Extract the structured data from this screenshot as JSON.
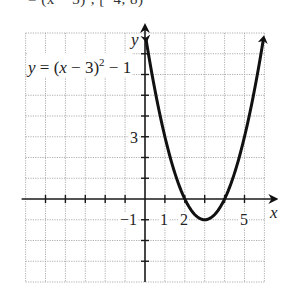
{
  "header": {
    "cut_text": "= (x − 3)², [−4, 8)"
  },
  "chart_data": {
    "type": "line",
    "title": "",
    "function": "y = (x - 3)^2 - 1",
    "equation_label": {
      "lhs": "y",
      "mid": " = (",
      "var": "x",
      "rhs": " − 3)",
      "exp": "2",
      "tail": " − 1"
    },
    "xlabel": "x",
    "ylabel": "y",
    "xlim": [
      -6,
      6
    ],
    "ylim": [
      -4,
      8
    ],
    "grid": true,
    "grid_style": "dotted",
    "x_tick_labels": [
      {
        "value": 1,
        "label": "1"
      },
      {
        "value": 2,
        "label": "2"
      },
      {
        "value": 5,
        "label": "5"
      }
    ],
    "y_tick_labels": [
      {
        "value": 3,
        "label": "3"
      },
      {
        "value": -1,
        "label": "−1"
      }
    ],
    "vertex": [
      3,
      -1
    ],
    "x_intercepts": [
      2,
      4
    ],
    "y_intercept": 8,
    "points": [
      [
        0.05,
        7.7
      ],
      [
        0.5,
        5.25
      ],
      [
        1,
        3
      ],
      [
        1.5,
        1.25
      ],
      [
        2,
        0
      ],
      [
        2.5,
        -0.75
      ],
      [
        3,
        -1
      ],
      [
        3.5,
        -0.75
      ],
      [
        4,
        0
      ],
      [
        4.5,
        1.25
      ],
      [
        5,
        3
      ],
      [
        5.5,
        5.25
      ],
      [
        5.95,
        7.7
      ]
    ],
    "arrows": "both ends",
    "legend": "none"
  },
  "colors": {
    "curve": "#111111",
    "axis": "#1a1a1a",
    "grid": "#9a9a9a",
    "background": "#ffffff"
  }
}
